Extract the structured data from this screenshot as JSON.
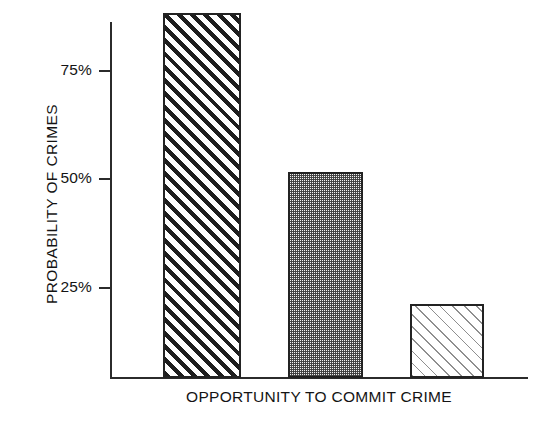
{
  "chart_data": {
    "type": "bar",
    "title": "",
    "subtitle": "",
    "xlabel": "OPPORTUNITY TO COMMIT CRIME",
    "ylabel": "PROBABILITY OF CRIMES",
    "categories": [
      "",
      "",
      ""
    ],
    "values": [
      84,
      47.5,
      17
    ],
    "value_unit": "%",
    "ylim": [
      0,
      92
    ],
    "yticks": [
      25,
      50,
      75
    ],
    "ytick_labels": [
      "25%",
      "50%",
      "75%"
    ],
    "grid": false,
    "legend": false,
    "legend_position": "none",
    "bar_patterns": [
      "bold-diagonal-hatch",
      "fine-checkerboard-stipple",
      "light-diagonal-hatch"
    ],
    "colors": {
      "axis": "#2b2b2b",
      "bar_outline": "#232323",
      "hatch_bold": "#1e1e1e",
      "stipple": "#3c3c3c",
      "hatch_light": "#8f8f8f",
      "background": "#ffffff",
      "text": "#141414"
    }
  },
  "axes": {
    "y_title": "PROBABILITY OF CRIMES",
    "x_title": "OPPORTUNITY TO COMMIT CRIME",
    "ticks": [
      {
        "label": "75%",
        "value": 75
      },
      {
        "label": "50%",
        "value": 50
      },
      {
        "label": "25%",
        "value": 25
      }
    ]
  },
  "bars": [
    {
      "name": "bar-one",
      "value": 84,
      "pattern": "bold-diagonal-hatch"
    },
    {
      "name": "bar-two",
      "value": 47.5,
      "pattern": "fine-checkerboard-stipple"
    },
    {
      "name": "bar-three",
      "value": 17,
      "pattern": "light-diagonal-hatch"
    }
  ]
}
